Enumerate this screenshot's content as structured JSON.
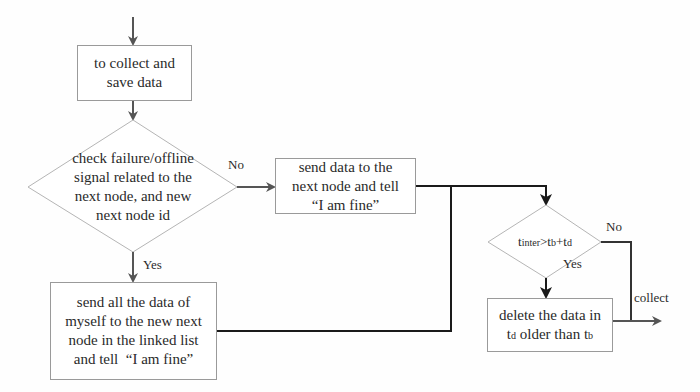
{
  "diagram": {
    "nodes": {
      "collect": {
        "text": "to collect and save data",
        "lines": [
          "to collect and",
          "save data"
        ]
      },
      "check": {
        "lines": [
          "check failure/offline",
          "signal related to the",
          "next node, and new",
          "next node id"
        ]
      },
      "send_fine": {
        "lines": [
          "send data to the",
          "next node and tell",
          "“I am fine”"
        ]
      },
      "send_all": {
        "lines": [
          "send all the data of",
          "myself to the new next",
          "node in the linked list",
          "and tell  “I am fine”"
        ]
      },
      "time_check": {
        "t_inter": "t",
        "t_inter_sub": "inter",
        "gt": ">",
        "t_b": "t",
        "t_b_sub": "b",
        "plus": "+",
        "t_d": "t",
        "t_d_sub": "d"
      },
      "delete": {
        "line1": "delete the data in",
        "line2_t": "t",
        "line2_sub_d": "d",
        "line2_mid": " older than ",
        "line2_t2": "t",
        "line2_sub_b": "b"
      }
    },
    "labels": {
      "check_no": "No",
      "check_yes": "Yes",
      "time_no": "No",
      "time_yes": "Yes",
      "collect": "collect"
    },
    "colors": {
      "arrow": "#555555",
      "thick_line": "#1a1a1a",
      "border": "#9a9a9a"
    }
  }
}
